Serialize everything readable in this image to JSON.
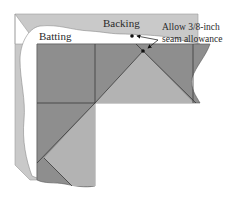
{
  "diagram": {
    "labels": {
      "backing": "Backing",
      "batting": "Batting",
      "note_line1": "Allow 3/8-inch",
      "note_line2": "seam allowance"
    },
    "layers": [
      {
        "name": "backing",
        "color": "#c9c9c9"
      },
      {
        "name": "batting",
        "color": "#ffffff"
      },
      {
        "name": "quilt-top-dark",
        "color": "#8e8e8e"
      },
      {
        "name": "quilt-top-light",
        "color": "#b3b3b3"
      }
    ],
    "markers": [
      {
        "name": "backing-edge-point"
      },
      {
        "name": "corner-point"
      }
    ]
  }
}
